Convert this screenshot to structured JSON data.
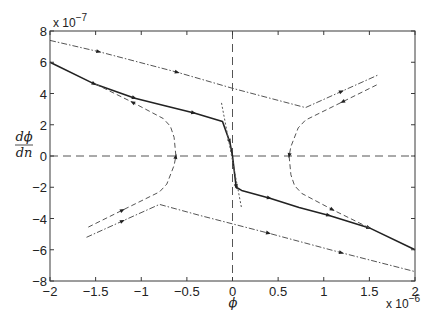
{
  "chart_data": {
    "type": "line",
    "title": "",
    "xlabel": "ϕ",
    "ylabel_numerator": "dϕ",
    "ylabel_denominator": "dn",
    "x_multiplier_label": "x 10",
    "x_multiplier_exp": "−6",
    "y_multiplier_label": "x 10",
    "y_multiplier_exp": "−7",
    "xlim": [
      -2,
      2
    ],
    "ylim": [
      -8,
      8
    ],
    "grid": false,
    "legend": null,
    "x_ticks": [
      -2,
      -1.5,
      -1,
      -0.5,
      0,
      0.5,
      1,
      1.5,
      2
    ],
    "x_tick_labels": [
      "−2",
      "−1.5",
      "−1",
      "−0.5",
      "0",
      "0.5",
      "1",
      "1.5",
      "2"
    ],
    "y_ticks": [
      -8,
      -6,
      -4,
      -2,
      0,
      2,
      4,
      6,
      8
    ],
    "y_tick_labels": [
      "−8",
      "−6",
      "−4",
      "−2",
      "0",
      "2",
      "4",
      "6",
      "8"
    ],
    "reference_lines": [
      {
        "name": "x-zero-line",
        "axis": "x",
        "value": 0,
        "style": "dashed"
      },
      {
        "name": "y-zero-line",
        "axis": "y",
        "value": 0,
        "style": "dashed"
      }
    ],
    "series": [
      {
        "name": "solid-trajectory",
        "style": "solid",
        "width": 1.6,
        "x": [
          -2.0,
          -1.51,
          -1.07,
          -0.73,
          -0.42,
          -0.11,
          -0.03,
          0.0,
          0.04,
          0.1,
          0.41,
          0.73,
          1.06,
          1.5,
          2.0
        ],
        "y": [
          6.0,
          4.6,
          3.7,
          3.2,
          2.75,
          2.2,
          0.9,
          0.0,
          -2.0,
          -2.2,
          -2.7,
          -3.3,
          -3.8,
          -4.6,
          -6.0
        ],
        "markers_at": [
          1,
          2,
          4,
          6,
          8,
          10,
          12,
          13
        ]
      },
      {
        "name": "upper-dashdot",
        "style": "dashdot",
        "width": 1,
        "x": [
          -2.0,
          -1.46,
          -0.6,
          0.0,
          0.8,
          1.2,
          1.6
        ],
        "y": [
          7.4,
          6.67,
          5.35,
          4.33,
          3.1,
          4.15,
          5.2
        ],
        "markers_at": [
          1,
          2,
          5
        ]
      },
      {
        "name": "lower-dashdot",
        "style": "dashdot",
        "width": 1,
        "x": [
          -1.6,
          -1.2,
          -0.8,
          -0.36,
          0.4,
          1.2,
          2.0
        ],
        "y": [
          -5.2,
          -4.15,
          -3.1,
          -3.8,
          -4.95,
          -6.2,
          -7.4
        ],
        "markers_at": [
          1,
          4,
          5
        ]
      },
      {
        "name": "right-dashed",
        "style": "dashed",
        "width": 1,
        "x": [
          1.58,
          1.2,
          0.8,
          0.72,
          0.64,
          0.62,
          0.64,
          0.68,
          0.76,
          1.1,
          1.5
        ],
        "y": [
          4.55,
          3.45,
          2.3,
          1.8,
          0.6,
          0.0,
          -1.2,
          -1.9,
          -2.4,
          -3.45,
          -4.6
        ],
        "markers_at": [
          1,
          5,
          9
        ]
      },
      {
        "name": "left-dashed",
        "style": "dashed",
        "width": 1,
        "x": [
          -1.58,
          -1.2,
          -0.8,
          -0.72,
          -0.64,
          -0.62,
          -0.64,
          -0.68,
          -0.76,
          -1.1,
          -1.5
        ],
        "y": [
          -4.55,
          -3.45,
          -2.3,
          -1.8,
          -0.6,
          0.0,
          1.2,
          1.9,
          2.4,
          3.45,
          4.6
        ],
        "markers_at": [
          1,
          5,
          9
        ]
      },
      {
        "name": "center-dotted",
        "style": "dotted",
        "width": 1,
        "x": [
          -0.12,
          0.1
        ],
        "y": [
          3.4,
          -3.35
        ],
        "markers_at": []
      }
    ]
  },
  "colors": {
    "axis": "#3a3a3a",
    "line": "#222222",
    "dashed": "#555555",
    "background": "#ffffff"
  }
}
